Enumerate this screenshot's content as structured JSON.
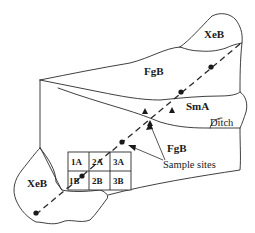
{
  "diagram": {
    "type": "soil-map-sampling-plan",
    "colors": {
      "line": "#2a2a2a",
      "text": "#1a1a1a",
      "background": "#ffffff"
    },
    "soil_units": [
      {
        "id": "xeb-top",
        "label": "XeB"
      },
      {
        "id": "fgb-upper",
        "label": "FgB"
      },
      {
        "id": "sma",
        "label": "SmA"
      },
      {
        "id": "fgb-lower",
        "label": "FgB"
      },
      {
        "id": "xeb-bottom",
        "label": "XeB"
      }
    ],
    "features": {
      "ditch_label": "Ditch",
      "sample_sites_label": "Sample sites"
    },
    "grid": {
      "rows": [
        [
          "1A",
          "2A",
          "3A"
        ],
        [
          "1B",
          "2B",
          "3B"
        ]
      ]
    },
    "transect": {
      "style": "dashed",
      "points": 6
    },
    "triangle_markers": 3
  }
}
